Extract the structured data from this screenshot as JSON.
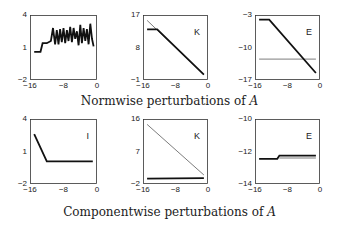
{
  "captions": {
    "top": "Normwise perturbations of",
    "bottom": "Componentwise perturbations of",
    "symbol": "A"
  },
  "chart_data": [
    {
      "type": "line",
      "row": "normwise",
      "label": "",
      "xlim": [
        -16,
        0
      ],
      "ylim": [
        -2,
        4
      ],
      "xticks": [
        "-16",
        "-8",
        "0"
      ],
      "yticks": [
        "4",
        "1",
        "-2"
      ],
      "series": [
        {
          "name": "thick",
          "x": [
            -15,
            -13.5,
            -13,
            -12,
            -11,
            -10.5,
            -10,
            -9.6,
            -9.2,
            -8.8,
            -8.4,
            -8,
            -7.6,
            -7.2,
            -6.8,
            -6.4,
            -6,
            -5.6,
            -5.2,
            -4.8,
            -4.4,
            -4,
            -3.6,
            -3.2,
            -2.8,
            -2.4,
            -2,
            -1.6,
            -1.2,
            -0.8
          ],
          "y": [
            0.6,
            0.6,
            1.4,
            1.4,
            1.6,
            2.8,
            1.3,
            2.6,
            1.3,
            2.7,
            1.5,
            2.8,
            1.4,
            2.6,
            1.6,
            2.9,
            1.5,
            2.8,
            1.8,
            2.5,
            1.2,
            3.1,
            1.4,
            2.8,
            1.6,
            2.7,
            1.3,
            3.2,
            1.8,
            1.1
          ]
        }
      ],
      "grid": false
    },
    {
      "type": "line",
      "row": "normwise",
      "label": "K",
      "xlim": [
        -16,
        0
      ],
      "ylim": [
        -1,
        17
      ],
      "xticks": [
        "-16",
        "-8",
        "0"
      ],
      "yticks": [
        "17",
        "8",
        "-1"
      ],
      "series": [
        {
          "name": "thin",
          "x": [
            -15,
            -1
          ],
          "y": [
            15.5,
            0.5
          ]
        },
        {
          "name": "thick",
          "x": [
            -15,
            -12.5,
            -1
          ],
          "y": [
            13,
            13,
            0.5
          ]
        }
      ],
      "grid": false
    },
    {
      "type": "line",
      "row": "normwise",
      "label": "E",
      "xlim": [
        -16,
        0
      ],
      "ylim": [
        -17,
        -3
      ],
      "xticks": [
        "-16",
        "-8",
        "0"
      ],
      "yticks": [
        "-3",
        "-10",
        "-17"
      ],
      "series": [
        {
          "name": "thin",
          "x": [
            -15,
            -1
          ],
          "y": [
            -12.5,
            -12.5
          ]
        },
        {
          "name": "thick",
          "x": [
            -15,
            -12.5,
            -1
          ],
          "y": [
            -4,
            -4,
            -15.5
          ]
        }
      ],
      "grid": false
    },
    {
      "type": "line",
      "row": "componentwise",
      "label": "I",
      "xlim": [
        -16,
        0
      ],
      "ylim": [
        -2,
        4
      ],
      "xticks": [
        "-16",
        "-8",
        "0"
      ],
      "yticks": [
        "4",
        "1",
        "-2"
      ],
      "series": [
        {
          "name": "thick",
          "x": [
            -15,
            -12,
            -1
          ],
          "y": [
            2.6,
            0.1,
            0.1
          ]
        }
      ],
      "grid": false
    },
    {
      "type": "line",
      "row": "componentwise",
      "label": "K",
      "xlim": [
        -16,
        0
      ],
      "ylim": [
        -2,
        16
      ],
      "xticks": [
        "-16",
        "-8",
        "0"
      ],
      "yticks": [
        "16",
        "7",
        "-2"
      ],
      "series": [
        {
          "name": "thin",
          "x": [
            -15,
            -1
          ],
          "y": [
            14.5,
            0.5
          ]
        },
        {
          "name": "thick",
          "x": [
            -15,
            -1
          ],
          "y": [
            -0.5,
            -0.4
          ]
        }
      ],
      "grid": false
    },
    {
      "type": "line",
      "row": "componentwise",
      "label": "E",
      "xlim": [
        -16,
        0
      ],
      "ylim": [
        -14,
        -10
      ],
      "xticks": [
        "-16",
        "-8",
        "0"
      ],
      "yticks": [
        "-10",
        "-12",
        "-14"
      ],
      "series": [
        {
          "name": "thick",
          "x": [
            -15,
            -10.5,
            -10,
            -1
          ],
          "y": [
            -12.45,
            -12.45,
            -12.25,
            -12.25
          ]
        },
        {
          "name": "thin",
          "x": [
            -10,
            -1
          ],
          "y": [
            -12.4,
            -12.4
          ]
        }
      ],
      "grid": false
    }
  ]
}
